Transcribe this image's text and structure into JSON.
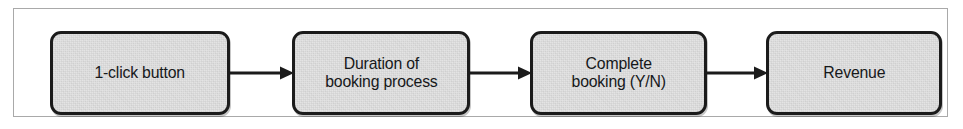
{
  "figure": {
    "type": "flow-diagram",
    "orientation": "left-to-right",
    "frame": {
      "visible": true,
      "border_color": "#a9a9a9"
    },
    "node_fill_color": "#e2e2e2",
    "node_border_color": "#1b1b1b",
    "text_color": "#16181a",
    "background_color": "#ffffff",
    "nodes": [
      {
        "id": "node-1",
        "label": "1-click button"
      },
      {
        "id": "node-2",
        "label": "Duration of\nbooking process"
      },
      {
        "id": "node-3",
        "label": "Complete\nbooking (Y/N)"
      },
      {
        "id": "node-4",
        "label": "Revenue"
      }
    ],
    "arrows": [
      {
        "id": "arrow-1",
        "from": "node-1",
        "to": "node-2"
      },
      {
        "id": "arrow-2",
        "from": "node-2",
        "to": "node-3"
      },
      {
        "id": "arrow-3",
        "from": "node-3",
        "to": "node-4"
      }
    ]
  }
}
